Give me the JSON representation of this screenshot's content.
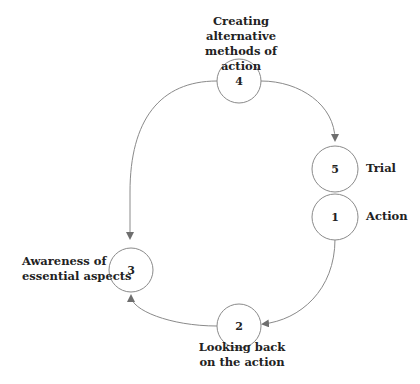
{
  "diagram": {
    "type": "cycle",
    "nodes": [
      {
        "id": "4",
        "number": "4",
        "label_line1": "Creating alternative",
        "label_line2": "methods of action"
      },
      {
        "id": "5",
        "number": "5",
        "label": "Trial"
      },
      {
        "id": "1",
        "number": "1",
        "label": "Action"
      },
      {
        "id": "2",
        "number": "2",
        "label_line1": "Looking back",
        "label_line2": "on the action"
      },
      {
        "id": "3",
        "number": "3",
        "label_line1": "Awareness of",
        "label_line2": "essential aspects"
      }
    ],
    "edges": [
      {
        "from": "4",
        "to": "5"
      },
      {
        "from": "1",
        "to": "2"
      },
      {
        "from": "2",
        "to": "3"
      },
      {
        "from": "4",
        "to": "3"
      }
    ],
    "colors": {
      "stroke": "#8a8a8a",
      "text": "#222222",
      "background": "#ffffff"
    }
  }
}
